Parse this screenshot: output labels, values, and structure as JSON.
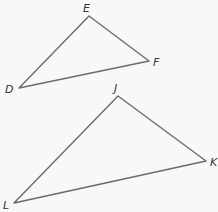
{
  "diagram": {
    "type": "similar-triangles",
    "triangles": [
      {
        "name": "DEF",
        "vertices": [
          {
            "label": "D",
            "x": 19,
            "y": 88,
            "lx": 5,
            "ly": 93
          },
          {
            "label": "E",
            "x": 89,
            "y": 16,
            "lx": 83,
            "ly": 12
          },
          {
            "label": "F",
            "x": 149,
            "y": 61,
            "lx": 153,
            "ly": 66
          }
        ]
      },
      {
        "name": "JKL",
        "vertices": [
          {
            "label": "J",
            "x": 118,
            "y": 96,
            "lx": 114,
            "ly": 92
          },
          {
            "label": "K",
            "x": 206,
            "y": 161,
            "lx": 210,
            "ly": 166
          },
          {
            "label": "L",
            "x": 14,
            "y": 203,
            "lx": 3,
            "ly": 209
          }
        ]
      }
    ],
    "line_color": "#6b6b6b",
    "background": "#f8f8f6"
  }
}
